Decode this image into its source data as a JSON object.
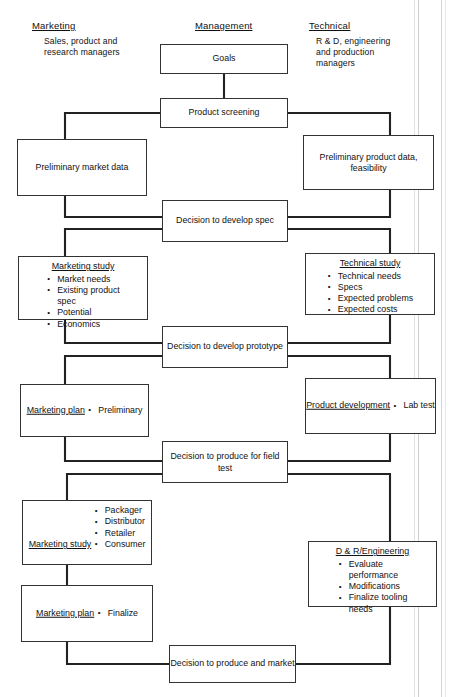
{
  "columns": [
    {
      "heading": "Marketing",
      "subtitle": "Sales, product and\nresearch managers"
    },
    {
      "heading": "Management",
      "subtitle": ""
    },
    {
      "heading": "Technical",
      "subtitle": "R & D, engineering\nand production\nmanagers"
    }
  ],
  "nodes": {
    "goals": {
      "text": "Goals"
    },
    "product_screening": {
      "text": "Product screening"
    },
    "prelim_market": {
      "text": "Preliminary\nmarket data"
    },
    "prelim_product": {
      "text": "Preliminary\nproduct data,\nfeasibility"
    },
    "decision_spec": {
      "text": "Decision to\ndevelop spec"
    },
    "marketing_study_1": {
      "title": "Marketing study",
      "items": [
        "Market needs",
        "Existing product\n          spec",
        "Potential",
        "Economics"
      ]
    },
    "technical_study": {
      "title": "Technical study",
      "items": [
        "Technical needs",
        "Specs",
        "Expected problems",
        "Expected costs"
      ]
    },
    "decision_proto": {
      "text": "Decision to develop\nprototype"
    },
    "marketing_plan_1": {
      "title": "Marketing plan",
      "items": [
        "Preliminary"
      ]
    },
    "product_dev": {
      "title": "Product development",
      "items": [
        "Lab test"
      ]
    },
    "decision_field": {
      "text": "Decision to produce\nfor field test"
    },
    "marketing_study_2": {
      "title": "Marketing study",
      "items": [
        "Packager",
        "Distributor",
        "Retailer",
        "Consumer"
      ]
    },
    "dr_engineering": {
      "title": "D & R/Engineering",
      "items": [
        "Evaluate\n      performance",
        "Modifications",
        "Finalize tooling\n        needs"
      ]
    },
    "marketing_plan_2": {
      "title": "Marketing plan",
      "items": [
        "Finalize"
      ]
    },
    "decision_market": {
      "text": "Decision to produce\nand market"
    }
  },
  "colors": {
    "line": "#222222",
    "box_border": "#333333",
    "background": "#ffffff"
  }
}
